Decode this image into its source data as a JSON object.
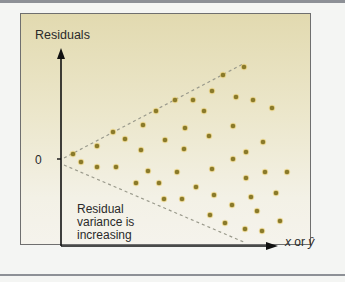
{
  "diagram": {
    "y_axis_label": "Residuals",
    "zero_tick_label": "0",
    "x_axis_label_x": "x",
    "x_axis_label_or": "or",
    "x_axis_label_yhat": "ŷ",
    "annotation": "Residual variance is increasing",
    "annotation_lines": [
      "Residual",
      "variance is",
      "increasing"
    ],
    "colors": {
      "panel_top": "#e2dab0",
      "panel_bottom": "#f5f3ec",
      "dot": "#8a7a2a",
      "dot_halo": "#e8c860",
      "dashed_line": "#9a9a8c",
      "axis": "#111111"
    }
  },
  "chart_data": {
    "type": "scatter",
    "title": "",
    "xlabel": "x or ŷ",
    "ylabel": "Residuals",
    "y_reference": 0,
    "envelope": {
      "upper": {
        "from": [
          0,
          0
        ],
        "to": [
          1,
          1
        ]
      },
      "lower": {
        "from": [
          0,
          0
        ],
        "to": [
          1,
          -1
        ]
      }
    },
    "points_pixel": [
      [
        73,
        154
      ],
      [
        81,
        162
      ],
      [
        97,
        146
      ],
      [
        97,
        167
      ],
      [
        113,
        132
      ],
      [
        116,
        167
      ],
      [
        125,
        139
      ],
      [
        136,
        183
      ],
      [
        141,
        150
      ],
      [
        143,
        125
      ],
      [
        148,
        171
      ],
      [
        156,
        111
      ],
      [
        159,
        183
      ],
      [
        164,
        199
      ],
      [
        165,
        140
      ],
      [
        175,
        100
      ],
      [
        177,
        172
      ],
      [
        182,
        199
      ],
      [
        184,
        149
      ],
      [
        185,
        128
      ],
      [
        193,
        100
      ],
      [
        196,
        187
      ],
      [
        204,
        111
      ],
      [
        209,
        136
      ],
      [
        210,
        215
      ],
      [
        212,
        91
      ],
      [
        212,
        169
      ],
      [
        214,
        195
      ],
      [
        223,
        75
      ],
      [
        225,
        223
      ],
      [
        232,
        205
      ],
      [
        233,
        126
      ],
      [
        233,
        159
      ],
      [
        236,
        97
      ],
      [
        244,
        67
      ],
      [
        245,
        229
      ],
      [
        246,
        152
      ],
      [
        246,
        178
      ],
      [
        251,
        197
      ],
      [
        253,
        100
      ],
      [
        257,
        211
      ],
      [
        262,
        231
      ],
      [
        263,
        142
      ],
      [
        265,
        172
      ],
      [
        272,
        108
      ],
      [
        276,
        193
      ],
      [
        280,
        221
      ],
      [
        287,
        172
      ]
    ],
    "grid": false,
    "legend": null
  }
}
